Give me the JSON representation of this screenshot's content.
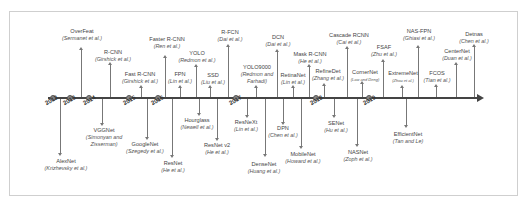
{
  "axis": {
    "years": [
      "2012",
      "2013",
      "2014",
      "2015",
      "2016",
      "2017",
      "2018",
      "2019"
    ]
  },
  "above": [
    {
      "name": "OverFeat",
      "authors": "(Sermanet et al.)"
    },
    {
      "name": "R-CNN",
      "authors": "(Girshick et al.)"
    },
    {
      "name": "Fast R-CNN",
      "authors": "(Girshick et al.)"
    },
    {
      "name": "Faster R-CNN",
      "authors": "(Ren et al.)"
    },
    {
      "name": "FPN",
      "authors": "(Lin et al.)"
    },
    {
      "name": "YOLO",
      "authors": "(Redmon et al.)"
    },
    {
      "name": "SSD",
      "authors": "(Liu et al.)"
    },
    {
      "name": "R-FCN",
      "authors": "(Dai et al.)"
    },
    {
      "name": "YOLO9000",
      "authors": "(Redmon and",
      "authors2": "Farhadi)"
    },
    {
      "name": "DCN",
      "authors": "(Dai et al.)"
    },
    {
      "name": "RetinaNet",
      "authors": "(Lin et al.)"
    },
    {
      "name": "Mask R-CNN",
      "authors": "(He et al.)"
    },
    {
      "name": "RefineDet",
      "authors": "(Zhang et al.)"
    },
    {
      "name": "Cascade RCNN",
      "authors": "(Cai et al.)"
    },
    {
      "name": "CornerNet",
      "authors": "(Law and Deng)"
    },
    {
      "name": "FSAF",
      "authors": "(Zhu et al.)"
    },
    {
      "name": "ExtremeNet",
      "authors": "(Zhou et al.)"
    },
    {
      "name": "NAS-FPN",
      "authors": "(Ghiasi et al.)"
    },
    {
      "name": "FCOS",
      "authors": "(Tian et al.)"
    },
    {
      "name": "CenterNet",
      "authors": "(Duan et al.)"
    },
    {
      "name": "Detnas",
      "authors": "(Chen et al.)"
    }
  ],
  "below": [
    {
      "name": "AlexNet",
      "authors": "(Krizhevsky et al.)"
    },
    {
      "name": "VGGNet",
      "authors": "(Simonyan and",
      "authors2": "Zisserman)"
    },
    {
      "name": "GoogleNet",
      "authors": "(Szegedy et al.)"
    },
    {
      "name": "ResNet",
      "authors": "(He et al.)"
    },
    {
      "name": "Hourglass",
      "authors": "(Newell et al.)"
    },
    {
      "name": "ResNet v2",
      "authors": "(He et al.)"
    },
    {
      "name": "ResNeXt",
      "authors": "(Lin et al.)"
    },
    {
      "name": "DenseNet",
      "authors": "(Huang et al.)"
    },
    {
      "name": "DPN",
      "authors": "(Chen et al.)"
    },
    {
      "name": "MobileNet",
      "authors": "(Howard et al.)"
    },
    {
      "name": "SENet",
      "authors": "(Hu et al.)"
    },
    {
      "name": "NASNet",
      "authors": "(Zoph et al.)"
    },
    {
      "name": "EfficientNet",
      "authors": "(Tan and Le)"
    }
  ]
}
